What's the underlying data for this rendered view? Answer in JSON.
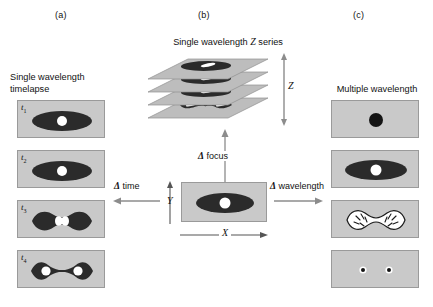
{
  "figure": {
    "panels": [
      {
        "id": "a",
        "label": "(a)",
        "caption": "Single wavelength\ntimelapse"
      },
      {
        "id": "b",
        "label": "(b)",
        "caption_pre": "Single wavelength ",
        "caption_ital": "Z",
        "caption_post": " series"
      },
      {
        "id": "c",
        "label": "(c)",
        "caption": "Multiple wavelength"
      }
    ],
    "timelapse": {
      "frames": [
        {
          "label": "t",
          "sub": "1",
          "state": "interphase-oval-nucleus"
        },
        {
          "label": "t",
          "sub": "2",
          "state": "interphase-oval-nucleus"
        },
        {
          "label": "t",
          "sub": "3",
          "state": "constricting-dumbbell-nucleus"
        },
        {
          "label": "t",
          "sub": "4",
          "state": "divided-two-daughter-cells"
        }
      ]
    },
    "zseries": {
      "axis_label": "Z",
      "slices": [
        {
          "index": 1,
          "state": "oval-cell-slit-nucleus"
        },
        {
          "index": 2,
          "state": "oval-cell-slit-nucleus"
        },
        {
          "index": 3,
          "state": "oval-cell-slit-nucleus"
        },
        {
          "index": 4,
          "state": "dumbbell-cell-two-nuclei"
        }
      ]
    },
    "center": {
      "x_axis_label": "X",
      "y_axis_label": "Y",
      "state": "oval-cell-round-nucleus"
    },
    "arrows": {
      "focus": {
        "delta": "Δ",
        "text": "focus"
      },
      "time": {
        "delta": "Δ",
        "text": "time"
      },
      "wavelength": {
        "delta": "Δ",
        "text": "wavelength"
      }
    },
    "wavelengths": {
      "channels": [
        {
          "index": 1,
          "state": "small-dark-nucleus-dot"
        },
        {
          "index": 2,
          "state": "dark-oval-cell-white-nucleus"
        },
        {
          "index": 3,
          "state": "white-dumbbell-chromosomes"
        },
        {
          "index": 4,
          "state": "two-small-centrosome-dots"
        }
      ]
    },
    "colors": {
      "panel_background": "#c9c9c9",
      "panel_border": "#9a9a9a",
      "cell_dark": "#2b2b2b",
      "nucleus_white": "#ffffff",
      "slice_plane": "#bdbdbd",
      "arrow_gray": "#8c8c8c",
      "text": "#111111"
    }
  }
}
